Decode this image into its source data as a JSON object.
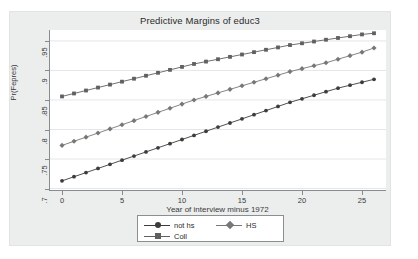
{
  "chart_data": {
    "type": "line",
    "title": "Predictive Margins of educ3",
    "xlabel": "Year of interview minus 1972",
    "ylabel": "Pr(Fepres)",
    "xlim": [
      -1,
      27
    ],
    "ylim": [
      0.6975,
      0.9685
    ],
    "grid": true,
    "grid_axis": "y",
    "legend_position": "bottom",
    "x": [
      0,
      1,
      2,
      3,
      4,
      5,
      6,
      7,
      8,
      9,
      10,
      11,
      12,
      13,
      14,
      15,
      16,
      17,
      18,
      19,
      20,
      21,
      22,
      23,
      24,
      25,
      26
    ],
    "xticks": [
      0,
      5,
      10,
      15,
      20,
      25
    ],
    "xtick_labels": [
      "0",
      "5",
      "10",
      "15",
      "20",
      "25"
    ],
    "yticks": [
      0.7,
      0.75,
      0.8,
      0.85,
      0.9,
      0.95
    ],
    "ytick_labels": [
      ".7",
      ".75",
      ".8",
      ".85",
      ".9",
      ".95"
    ],
    "series": [
      {
        "name": "not hs",
        "marker": "circle",
        "color": "#3c3c3c",
        "values": [
          0.713,
          0.72,
          0.727,
          0.734,
          0.741,
          0.748,
          0.755,
          0.762,
          0.769,
          0.776,
          0.783,
          0.79,
          0.797,
          0.804,
          0.811,
          0.818,
          0.825,
          0.832,
          0.839,
          0.846,
          0.852,
          0.858,
          0.864,
          0.87,
          0.875,
          0.88,
          0.885
        ]
      },
      {
        "name": "HS",
        "marker": "diamond",
        "color": "#777777",
        "values": [
          0.773,
          0.78,
          0.787,
          0.794,
          0.801,
          0.808,
          0.815,
          0.822,
          0.829,
          0.836,
          0.843,
          0.85,
          0.856,
          0.862,
          0.868,
          0.874,
          0.88,
          0.886,
          0.892,
          0.898,
          0.903,
          0.908,
          0.913,
          0.919,
          0.925,
          0.931,
          0.938
        ]
      },
      {
        "name": "Coll",
        "marker": "square",
        "color": "#606060",
        "values": [
          0.856,
          0.861,
          0.866,
          0.871,
          0.876,
          0.881,
          0.886,
          0.891,
          0.896,
          0.901,
          0.906,
          0.911,
          0.915,
          0.919,
          0.923,
          0.927,
          0.931,
          0.935,
          0.939,
          0.943,
          0.946,
          0.949,
          0.952,
          0.955,
          0.958,
          0.961,
          0.963
        ]
      }
    ]
  },
  "legend": {
    "entries": [
      {
        "label": "not hs"
      },
      {
        "label": "HS"
      },
      {
        "label": "Coll"
      }
    ]
  },
  "colors": {
    "plot_background": "#ffffff",
    "graph_background": "#eceded",
    "gridline": "#e3e6ea",
    "axis": "#888c8e",
    "text": "#3a3a3a"
  }
}
